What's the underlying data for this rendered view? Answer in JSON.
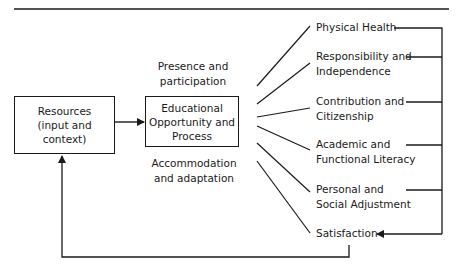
{
  "diagram": {
    "input_box": {
      "lines": [
        "Resources",
        "(input and context)"
      ]
    },
    "process_box": {
      "lines": [
        "Educational",
        "Opportunity and",
        "Process"
      ]
    },
    "process_annotations": {
      "above": [
        "Presence and",
        "participation"
      ],
      "below": [
        "Accommodation",
        "and adaptation"
      ]
    },
    "outcomes": [
      {
        "lines": [
          "Physical Health"
        ]
      },
      {
        "lines": [
          "Responsibility and",
          "Independence"
        ]
      },
      {
        "lines": [
          "Contribution and",
          "Citizenship"
        ]
      },
      {
        "lines": [
          "Academic and",
          "Functional Literacy"
        ]
      },
      {
        "lines": [
          "Personal and",
          "Social Adjustment"
        ]
      },
      {
        "lines": [
          "Satisfaction"
        ]
      }
    ],
    "colors": {
      "stroke": "#1a1a1a",
      "background": "#ffffff"
    }
  }
}
